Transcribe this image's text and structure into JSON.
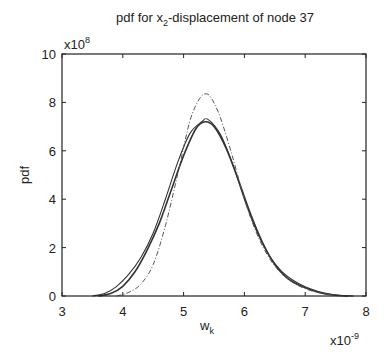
{
  "chart_data": {
    "type": "line",
    "title": "pdf for x2-displacement of node 37",
    "title_parts": {
      "pre": "pdf for x",
      "sub": "2",
      "post": "-displacement of node 37"
    },
    "xlabel": "w",
    "xlabel_sub": "k",
    "ylabel": "pdf",
    "x_multiplier": "x10",
    "x_multiplier_exp": "-9",
    "y_multiplier": "x10",
    "y_multiplier_exp": "8",
    "xlim": [
      3,
      8
    ],
    "ylim": [
      0,
      10
    ],
    "xticks": [
      "3",
      "4",
      "5",
      "6",
      "7",
      "8"
    ],
    "yticks": [
      "0",
      "2",
      "4",
      "6",
      "8",
      "10"
    ],
    "grid": false,
    "legend": null,
    "series": [
      {
        "name": "solid curve 1 (thick)",
        "style": "solid",
        "x": [
          3.6,
          3.8,
          4.0,
          4.2,
          4.4,
          4.6,
          4.8,
          5.0,
          5.2,
          5.35,
          5.5,
          5.7,
          5.9,
          6.1,
          6.3,
          6.5,
          6.7,
          6.9,
          7.1,
          7.3,
          7.5,
          7.7
        ],
        "values": [
          0.0,
          0.1,
          0.4,
          1.0,
          1.9,
          3.0,
          4.4,
          5.8,
          6.9,
          7.2,
          7.0,
          6.1,
          4.8,
          3.4,
          2.2,
          1.3,
          0.75,
          0.45,
          0.25,
          0.1,
          0.03,
          0.0
        ]
      },
      {
        "name": "solid curve 2",
        "style": "solid",
        "x": [
          3.5,
          3.7,
          3.9,
          4.1,
          4.3,
          4.5,
          4.7,
          4.9,
          5.1,
          5.3,
          5.4,
          5.6,
          5.8,
          6.0,
          6.2,
          6.4,
          6.6,
          6.8,
          7.0,
          7.2,
          7.4,
          7.6,
          7.8
        ],
        "values": [
          0.0,
          0.1,
          0.4,
          0.9,
          1.6,
          2.6,
          4.0,
          5.5,
          6.7,
          7.2,
          7.3,
          6.7,
          5.5,
          4.0,
          2.7,
          1.7,
          1.05,
          0.65,
          0.38,
          0.2,
          0.08,
          0.02,
          0.0
        ]
      },
      {
        "name": "dash-dot curve",
        "style": "dash-dot",
        "x": [
          3.9,
          4.1,
          4.3,
          4.5,
          4.7,
          4.9,
          5.1,
          5.25,
          5.35,
          5.45,
          5.6,
          5.8,
          6.0,
          6.2,
          6.4,
          6.6,
          6.8,
          7.0,
          7.2,
          7.4,
          7.6,
          7.8
        ],
        "values": [
          0.0,
          0.15,
          0.5,
          1.3,
          2.9,
          5.0,
          7.2,
          8.1,
          8.35,
          8.2,
          7.4,
          5.8,
          4.0,
          2.6,
          1.6,
          0.95,
          0.55,
          0.3,
          0.15,
          0.06,
          0.02,
          0.0
        ]
      }
    ]
  }
}
